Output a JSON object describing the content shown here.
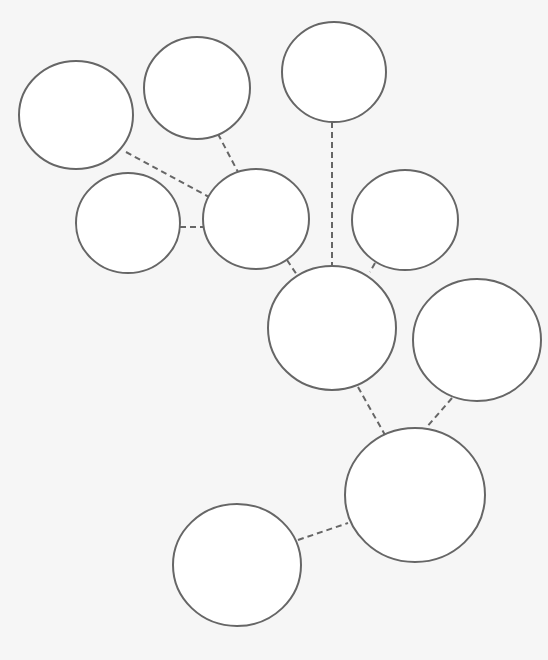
{
  "diagram": {
    "type": "node-link",
    "background": "#f6f6f6",
    "node_fill": "#ffffff",
    "stroke_color": "#666666",
    "edge_style": "dashed",
    "nodes": [
      {
        "id": "A",
        "cx": 76,
        "cy": 115,
        "rx": 57,
        "ry": 54,
        "label": ""
      },
      {
        "id": "B",
        "cx": 197,
        "cy": 88,
        "rx": 53,
        "ry": 51,
        "label": ""
      },
      {
        "id": "C",
        "cx": 334,
        "cy": 72,
        "rx": 52,
        "ry": 50,
        "label": ""
      },
      {
        "id": "D",
        "cx": 128,
        "cy": 223,
        "rx": 52,
        "ry": 50,
        "label": ""
      },
      {
        "id": "E",
        "cx": 256,
        "cy": 219,
        "rx": 53,
        "ry": 50,
        "label": ""
      },
      {
        "id": "F",
        "cx": 405,
        "cy": 220,
        "rx": 53,
        "ry": 50,
        "label": ""
      },
      {
        "id": "G",
        "cx": 332,
        "cy": 328,
        "rx": 64,
        "ry": 62,
        "label": ""
      },
      {
        "id": "H",
        "cx": 477,
        "cy": 340,
        "rx": 64,
        "ry": 61,
        "label": ""
      },
      {
        "id": "I",
        "cx": 415,
        "cy": 495,
        "rx": 70,
        "ry": 67,
        "label": ""
      },
      {
        "id": "J",
        "cx": 237,
        "cy": 565,
        "rx": 64,
        "ry": 61,
        "label": ""
      }
    ],
    "edges": [
      {
        "from": "A",
        "to": "E",
        "x1": 126,
        "y1": 152,
        "x2": 209,
        "y2": 197
      },
      {
        "from": "B",
        "to": "E",
        "x1": 218,
        "y1": 134,
        "x2": 238,
        "y2": 172
      },
      {
        "from": "D",
        "to": "E",
        "x1": 180,
        "y1": 227,
        "x2": 204,
        "y2": 227
      },
      {
        "from": "E",
        "to": "G",
        "x1": 287,
        "y1": 260,
        "x2": 297,
        "y2": 275
      },
      {
        "from": "C",
        "to": "G",
        "x1": 332,
        "y1": 122,
        "x2": 332,
        "y2": 266
      },
      {
        "from": "F",
        "to": "G",
        "x1": 375,
        "y1": 263,
        "x2": 370,
        "y2": 272
      },
      {
        "from": "G",
        "to": "I",
        "x1": 358,
        "y1": 387,
        "x2": 385,
        "y2": 435
      },
      {
        "from": "H",
        "to": "I",
        "x1": 452,
        "y1": 398,
        "x2": 426,
        "y2": 428
      },
      {
        "from": "J",
        "to": "I",
        "x1": 298,
        "y1": 540,
        "x2": 348,
        "y2": 523
      }
    ]
  }
}
